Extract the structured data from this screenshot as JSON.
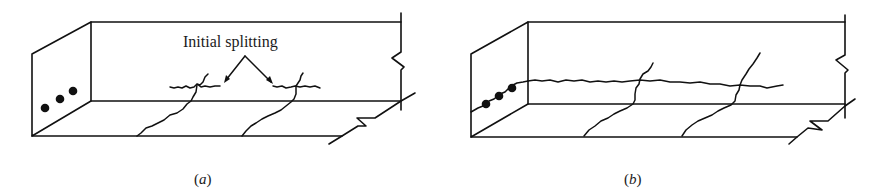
{
  "figure": {
    "panels": [
      {
        "id": "a",
        "caption_open": "(",
        "caption_letter": "a",
        "caption_close": ")",
        "annotation": "Initial splitting",
        "bars": 3
      },
      {
        "id": "b",
        "caption_open": "(",
        "caption_letter": "b",
        "caption_close": ")",
        "bars": 3
      }
    ]
  }
}
